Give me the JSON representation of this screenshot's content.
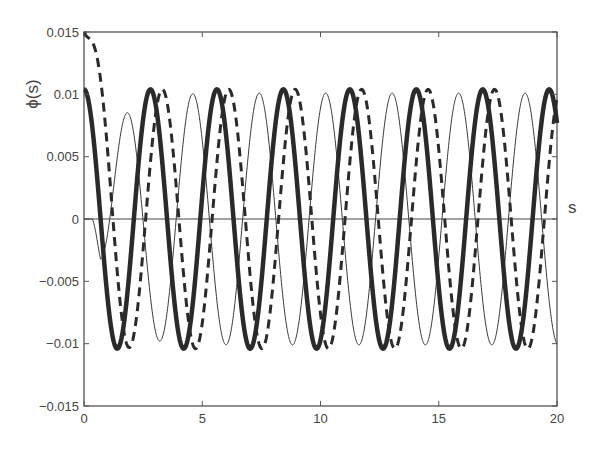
{
  "chart_data": {
    "type": "line",
    "title": "",
    "xlabel": "s",
    "ylabel": "ϕ(s)",
    "xlim": [
      0,
      20
    ],
    "ylim": [
      -0.015,
      0.015
    ],
    "xticks": [
      0,
      5,
      10,
      15,
      20
    ],
    "xtick_labels": [
      "0",
      "5",
      "10",
      "15",
      "20"
    ],
    "yticks": [
      -0.015,
      -0.01,
      -0.005,
      0,
      0.005,
      0.01,
      0.015
    ],
    "ytick_labels": [
      "−0.015",
      "−0.01",
      "−0.005",
      "0",
      "0.005",
      "0.01",
      "0.015"
    ],
    "grid": false,
    "legend": null,
    "zero_line": true,
    "series": [
      {
        "name": "thick-solid",
        "style": "solid",
        "width": 4.5,
        "color": "#2a2a2a",
        "model": {
          "amp": 0.0104,
          "period": 2.81,
          "phase_x": 0.0,
          "transient_amp": 0.0,
          "transient_rate": 0,
          "onset": 0,
          "ramp": 0
        },
        "x": [
          0,
          1.4,
          2.8,
          4.2,
          5.6,
          7.0,
          8.4,
          9.8,
          11.2,
          12.6,
          14.0,
          15.4,
          16.8,
          18.2,
          19.6,
          20
        ],
        "values": [
          0.0104,
          -0.0104,
          0.0104,
          -0.0104,
          0.0104,
          -0.0104,
          0.0104,
          -0.0104,
          0.0104,
          -0.0104,
          0.0104,
          -0.0104,
          0.0104,
          -0.0104,
          0.0104,
          0.0095
        ]
      },
      {
        "name": "dashed",
        "style": "dashed",
        "width": 3,
        "color": "#2a2a2a",
        "model": {
          "amp": 0.0104,
          "period": 2.81,
          "phase_x": 0.5,
          "transient_amp": 0.0105,
          "transient_rate": 2.5,
          "onset": 0,
          "ramp": 0
        },
        "x": [
          0,
          0.5,
          1.0,
          1.9,
          3.3,
          4.7,
          6.1,
          7.5,
          8.9,
          10.3,
          11.7,
          13.1,
          14.5,
          15.9,
          17.3,
          18.7,
          20
        ],
        "values": [
          0.015,
          0.012,
          0.004,
          -0.0104,
          0.0104,
          -0.0104,
          0.0104,
          -0.0104,
          0.0104,
          -0.0104,
          0.0104,
          -0.0104,
          0.0104,
          -0.0104,
          0.0104,
          -0.0104,
          0.0075
        ]
      },
      {
        "name": "thin-solid",
        "style": "solid",
        "width": 1,
        "color": "#3a3a3a",
        "model": {
          "amp": 0.0101,
          "period": 2.81,
          "phase_x": 4.6,
          "transient_amp": 0.0,
          "transient_rate": 0,
          "onset": 0.35,
          "ramp": 2.6
        },
        "x": [
          0,
          0.35,
          0.9,
          1.3,
          1.95,
          3.2,
          4.6,
          6.0,
          7.4,
          8.8,
          10.2,
          11.6,
          13.0,
          14.4,
          15.8,
          17.2,
          18.6,
          20
        ],
        "values": [
          0,
          0,
          -0.0013,
          0,
          0.0054,
          -0.0088,
          0.0101,
          -0.0101,
          0.0101,
          -0.0101,
          0.0101,
          -0.0101,
          0.0101,
          -0.0101,
          0.0101,
          -0.0101,
          0.0101,
          -0.0095
        ]
      }
    ]
  },
  "plot": {
    "left": 84,
    "right": 557,
    "top": 32,
    "bottom": 406,
    "background": "#ffffff",
    "axis_color": "#555555",
    "ylabel_pos": {
      "x": 38,
      "y": 94
    },
    "xlabel_pos": {
      "x": 568,
      "y": 213
    }
  }
}
